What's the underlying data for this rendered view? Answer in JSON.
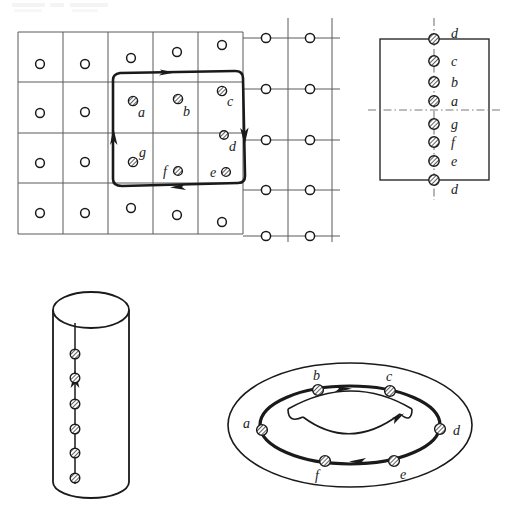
{
  "figure": {
    "title": "",
    "background": "#ffffff",
    "ink": "#1a1a1a",
    "grid_line_color": "#555555",
    "panels": [
      {
        "id": "lattice-panel",
        "name": "lattice-with-loop",
        "description": "Square lattice with open-circle sites and a closed oriented loop enclosing seven crossed sites"
      },
      {
        "id": "rectangle-panel",
        "name": "identified-rectangle",
        "description": "Rectangle with vertical and horizontal dash-dot identification axes and eight crossed sites"
      },
      {
        "id": "cylinder-panel",
        "name": "cylinder",
        "description": "Cylinder with six crossed sites along an upward oriented seam line"
      },
      {
        "id": "torus-panel",
        "name": "torus",
        "description": "Torus with an oriented loop carrying six crossed sites"
      }
    ],
    "lattice": {
      "columns": 7,
      "rows": 5,
      "open_site_label": "open-circle-site",
      "crossed_site_label": "crossed-circle-site",
      "loop_labels": [
        "a",
        "b",
        "c",
        "d",
        "e",
        "f",
        "g"
      ],
      "loop_direction": "clockwise",
      "arrow_count": 4
    },
    "rectangle": {
      "marker_labels": [
        "d",
        "c",
        "b",
        "a",
        "g",
        "f",
        "e",
        "d"
      ],
      "axis_style": "dash-dot",
      "vertical_axis": true,
      "horizontal_axis": true
    },
    "cylinder": {
      "marker_count": 6,
      "seam_arrow": "up"
    },
    "torus": {
      "marker_labels": [
        "a",
        "b",
        "c",
        "d",
        "e",
        "f"
      ],
      "arrow_top": "right",
      "arrow_bottom": "left",
      "inner_arrow": "right"
    }
  }
}
